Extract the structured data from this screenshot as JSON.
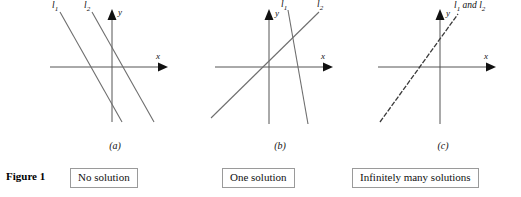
{
  "figure": {
    "label": "Figure 1",
    "background_color": "#ffffff",
    "line_color": "#6e6e6e",
    "axis_color": "#555555",
    "text_color": "#111111",
    "box_border_color": "#9a9a9a"
  },
  "panels": [
    {
      "id": "a",
      "letter": "(a)",
      "caption": "No solution",
      "x_axis_label": "x",
      "y_axis_label": "y",
      "line_labels": [
        {
          "base": "l",
          "sub": "1"
        },
        {
          "base": "l",
          "sub": "2"
        }
      ],
      "description": "Two parallel lines with negative slope that never meet"
    },
    {
      "id": "b",
      "letter": "(b)",
      "caption": "One solution",
      "x_axis_label": "x",
      "y_axis_label": "y",
      "line_labels": [
        {
          "base": "l",
          "sub": "1"
        },
        {
          "base": "l",
          "sub": "2"
        }
      ],
      "description": "Two lines with different slopes intersecting at one point"
    },
    {
      "id": "c",
      "letter": "(c)",
      "caption": "Infinitely many solutions",
      "x_axis_label": "x",
      "y_axis_label": "y",
      "line_labels": [
        {
          "base": "l",
          "middle": " and ",
          "sub": "1",
          "base2": "l",
          "sub2": "2"
        }
      ],
      "combined_label_prefix": "l",
      "combined_label_sub1": "1",
      "combined_label_middle": " and ",
      "combined_label_base2": "l",
      "combined_label_sub2": "2",
      "description": "Two coincident lines drawn as a single dashed line"
    }
  ]
}
